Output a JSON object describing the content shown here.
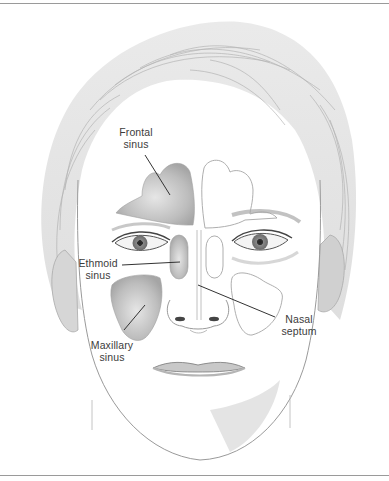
{
  "figure": {
    "labels": {
      "frontal": "Frontal\nsinus",
      "ethmoid": "Ethmoid\nsinus",
      "maxillary": "Maxillary\nsinus",
      "septum": "Nasal\nseptum"
    },
    "colors": {
      "sinus_fill": "#b9b9b9",
      "sinus_outline": "#9e9e9e",
      "leader_line": "#333333",
      "label_text": "#3c3c3c",
      "rule": "#9a9a9a"
    }
  }
}
